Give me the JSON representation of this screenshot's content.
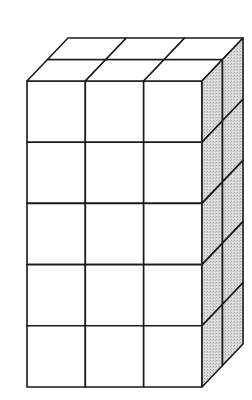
{
  "figure": {
    "dimensions": {
      "width_cubes": 3,
      "depth_cubes": 2,
      "height_cubes": 5
    },
    "total_cubes": 30,
    "faces": {
      "front": {
        "columns": 3,
        "rows": 5,
        "fill": "#ffffff"
      },
      "top": {
        "columns": 3,
        "rows": 2,
        "fill": "#ffffff"
      },
      "right": {
        "columns": 2,
        "rows": 5,
        "fill": "#d4d4d4",
        "shading": "stippled"
      }
    },
    "colors": {
      "line": "#1a1a1a",
      "background": "#ffffff",
      "shade": "#d4d4d4"
    }
  }
}
